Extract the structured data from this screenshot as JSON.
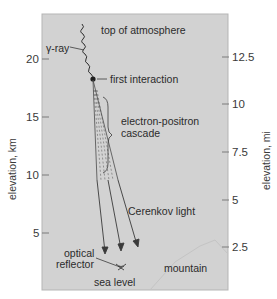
{
  "diagram": {
    "colors": {
      "panel": "#d2d2d2",
      "panel_border": "#b5b5b5",
      "line": "#3a3a3a",
      "text": "#2b2b2b"
    },
    "labels": {
      "top_of_atmosphere": "top of atmosphere",
      "gamma_ray": "γ-ray",
      "first_interaction": "first interaction",
      "cascade_line1": "electron-positron",
      "cascade_line2": "cascade",
      "cerenkov_light": "Cerenkov light",
      "optical_line1": "optical",
      "optical_line2": "reflector",
      "sea_level": "sea level",
      "mountain": "mountain"
    },
    "left_axis": {
      "title": "elevation, km",
      "ticks": [
        "20",
        "15",
        "10",
        "5"
      ]
    },
    "right_axis": {
      "title": "elevation, mi",
      "ticks": [
        "12.5",
        "10",
        "7.5",
        "5",
        "2.5"
      ]
    }
  }
}
